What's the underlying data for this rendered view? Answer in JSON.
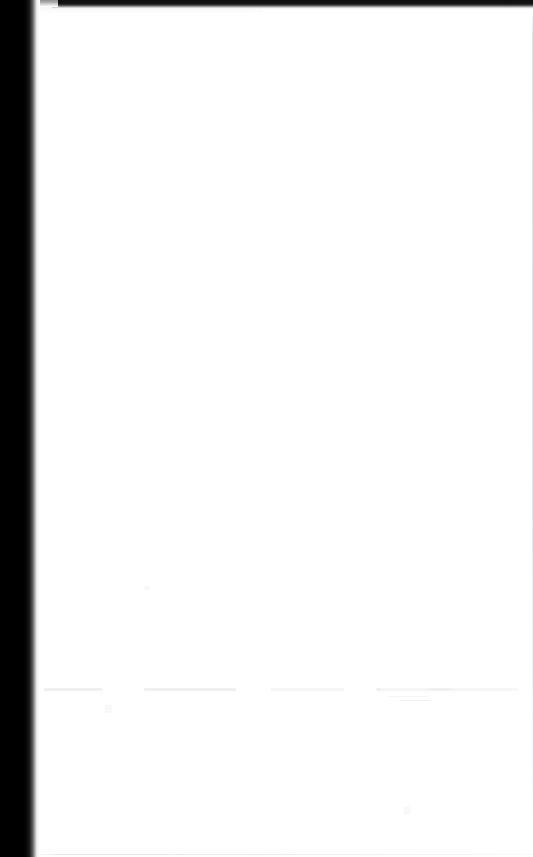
{
  "document": {
    "page_title": "",
    "body_text": "",
    "visible_text": "",
    "note": ""
  },
  "page": {
    "width_px": 533,
    "height_px": 857,
    "background_color": "#ffffff",
    "paper_color": "#ffffff",
    "content": "blank"
  },
  "scan_artifacts": {
    "binding_shadow": {
      "label": "",
      "color": "#000000",
      "edge_color": "#ffffff",
      "side": "left",
      "width_px": 40
    },
    "top_edge_bar": {
      "label": "",
      "color": "#0e0e0e",
      "side": "top",
      "height_px": 9
    },
    "page_border": {
      "label": "",
      "color": "#dde0e5"
    }
  },
  "ghost_ink": {
    "row_a": {
      "text": "",
      "segments": [
        58,
        92,
        74,
        110,
        48,
        66,
        82
      ]
    },
    "row_b": {
      "text": "",
      "segments": [
        40,
        30
      ]
    },
    "marks": {
      "mark_1": "",
      "mark_2": "",
      "mark_3": ""
    }
  }
}
